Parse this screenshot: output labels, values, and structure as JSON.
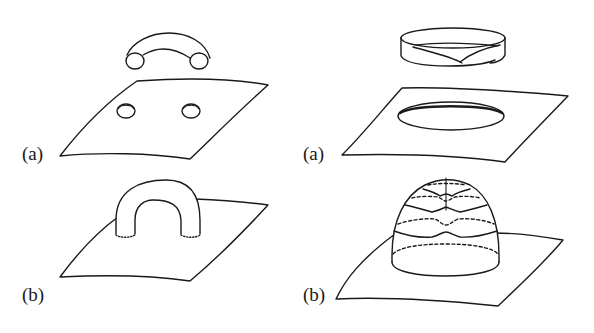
{
  "figure": {
    "panels": [
      {
        "id": "left-a",
        "label": "(a)",
        "description": "Handle (tube segment) above a plane with two circular holes"
      },
      {
        "id": "right-a",
        "label": "(a)",
        "description": "Mobius band above a plane with one large elliptical hole"
      },
      {
        "id": "left-b",
        "label": "(b)",
        "description": "Handle attached to plane, dotted attachment circles"
      },
      {
        "id": "right-b",
        "label": "(b)",
        "description": "Cross-cap dome attached to plane with dashed/solid level curves and vertical seam"
      }
    ]
  }
}
